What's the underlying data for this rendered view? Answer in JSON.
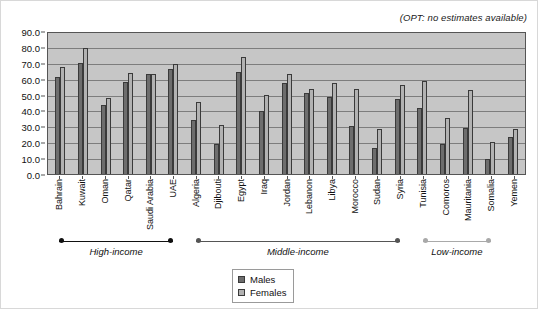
{
  "annotation": "(OPT: no estimates available)",
  "legend": {
    "position": "bottom-center",
    "items": [
      {
        "label": "Males",
        "color": "#6d6d6d"
      },
      {
        "label": "Females",
        "color": "#b2b2b2"
      }
    ]
  },
  "income_groups": [
    {
      "label": "High-income",
      "start": 0,
      "end": 5,
      "style": "dark"
    },
    {
      "label": "Middle-income",
      "start": 6,
      "end": 15,
      "style": "mid"
    },
    {
      "label": "Low-income",
      "start": 16,
      "end": 19,
      "style": "light"
    }
  ],
  "chart_data": {
    "type": "bar",
    "title": "",
    "subtitle": "",
    "xlabel": "",
    "ylabel": "",
    "ylim": [
      0,
      90
    ],
    "ytick_labels": [
      "0.0",
      "10.0",
      "20.0",
      "30.0",
      "40.0",
      "50.0",
      "60.0",
      "70.0",
      "80.0",
      "90.0"
    ],
    "yticks": [
      0,
      10,
      20,
      30,
      40,
      50,
      60,
      70,
      80,
      90
    ],
    "grid": true,
    "annotation": "(OPT: no estimates available)",
    "categories": [
      "Bahrain",
      "Kuwait",
      "Oman",
      "Qatar",
      "Saudi Arabia",
      "UAE",
      "Algeria",
      "Djibouti",
      "Egypt",
      "Iraq",
      "Jordan",
      "Lebanon",
      "Libya",
      "Morocco",
      "Sudan",
      "Syria",
      "Tunisia",
      "Comoros",
      "Mauritania",
      "Somalia",
      "Yemen"
    ],
    "series": [
      {
        "name": "Males",
        "color": "#6d6d6d",
        "values": [
          61.0,
          69.8,
          43.4,
          57.8,
          62.8,
          66.2,
          33.7,
          18.6,
          64.2,
          39.4,
          57.0,
          50.8,
          48.5,
          30.3,
          16.3,
          47.3,
          41.6,
          19.1,
          29.0,
          9.7,
          23.3
        ]
      },
      {
        "name": "Females",
        "color": "#b2b2b2",
        "values": [
          67.2,
          79.5,
          47.8,
          63.8,
          63.2,
          69.4,
          45.3,
          30.8,
          73.8,
          49.9,
          63.0,
          53.4,
          57.0,
          53.6,
          28.4,
          56.0,
          58.3,
          35.1,
          53.1,
          20.0,
          28.5
        ]
      }
    ]
  }
}
